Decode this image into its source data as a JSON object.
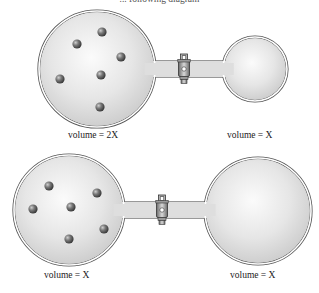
{
  "caption": "... following diagram",
  "colors": {
    "glass_fill": "#e4e4e4",
    "glass_highlight": "#fafafa",
    "glass_outline": "#555555",
    "particle": "#6a6a6a",
    "valve": "#8a8a8a"
  },
  "setups": [
    {
      "id": "top",
      "left_flask": {
        "label": "volume = 2X",
        "cx": 97,
        "cy": 69,
        "r": 58,
        "particles": [
          [
            102,
            32
          ],
          [
            77,
            44
          ],
          [
            121,
            57
          ],
          [
            101,
            75
          ],
          [
            60,
            79
          ],
          [
            100,
            107
          ]
        ]
      },
      "right_flask": {
        "label": "volume = X",
        "cx": 255,
        "cy": 69,
        "r": 32,
        "particles": []
      },
      "tube": {
        "y1": 62,
        "y2": 76
      },
      "valve": {
        "x": 184,
        "y": 69
      }
    },
    {
      "id": "bottom",
      "left_flask": {
        "label": "volume = X",
        "cx": 69,
        "cy": 210,
        "r": 55,
        "particles": [
          [
            49,
            186
          ],
          [
            97,
            193
          ],
          [
            71,
            207
          ],
          [
            33,
            209
          ],
          [
            104,
            229
          ],
          [
            69,
            239
          ]
        ]
      },
      "right_flask": {
        "label": "volume = X",
        "cx": 258,
        "cy": 211,
        "r": 53,
        "particles": []
      },
      "tube": {
        "y1": 203,
        "y2": 217
      },
      "valve": {
        "x": 162,
        "y": 210
      }
    }
  ]
}
